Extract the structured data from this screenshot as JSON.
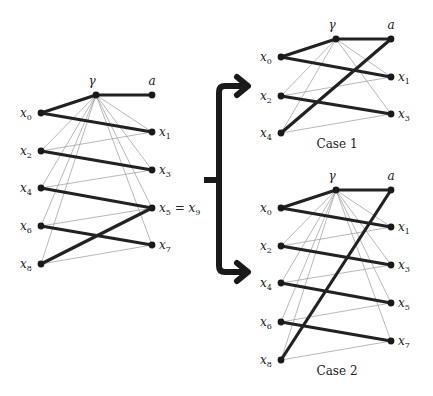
{
  "colors": {
    "ink": "#222222",
    "thin_edge": "#9a9a9a",
    "background": "#ffffff"
  },
  "graphs": [
    {
      "id": "original",
      "nodes": [
        {
          "id": "gamma",
          "label": "γ",
          "sub": "",
          "x": 96,
          "y": 95,
          "lx": 92,
          "ly": 85,
          "anchor": "middle"
        },
        {
          "id": "a",
          "label": "a",
          "sub": "",
          "x": 152,
          "y": 95,
          "lx": 152,
          "ly": 85,
          "anchor": "middle"
        },
        {
          "id": "x0",
          "label": "x",
          "sub": "0",
          "x": 41,
          "y": 113,
          "lx": 20,
          "ly": 117,
          "anchor": "start"
        },
        {
          "id": "x1",
          "label": "x",
          "sub": "1",
          "x": 152,
          "y": 132,
          "lx": 159,
          "ly": 136,
          "anchor": "start"
        },
        {
          "id": "x2",
          "label": "x",
          "sub": "2",
          "x": 41,
          "y": 151,
          "lx": 20,
          "ly": 155,
          "anchor": "start"
        },
        {
          "id": "x3",
          "label": "x",
          "sub": "3",
          "x": 152,
          "y": 170,
          "lx": 159,
          "ly": 174,
          "anchor": "start"
        },
        {
          "id": "x4",
          "label": "x",
          "sub": "4",
          "x": 41,
          "y": 188,
          "lx": 20,
          "ly": 192,
          "anchor": "start"
        },
        {
          "id": "x5",
          "label": "x",
          "sub": "5",
          "x": 152,
          "y": 208,
          "lx": 159,
          "ly": 212,
          "anchor": "start",
          "suffix": " = x",
          "suffix_sub": "9"
        },
        {
          "id": "x6",
          "label": "x",
          "sub": "6",
          "x": 41,
          "y": 226,
          "lx": 20,
          "ly": 230,
          "anchor": "start"
        },
        {
          "id": "x7",
          "label": "x",
          "sub": "7",
          "x": 152,
          "y": 245,
          "lx": 159,
          "ly": 249,
          "anchor": "start"
        },
        {
          "id": "x8",
          "label": "x",
          "sub": "8",
          "x": 41,
          "y": 264,
          "lx": 20,
          "ly": 268,
          "anchor": "start"
        }
      ],
      "thick_edges": [
        [
          "gamma",
          "a"
        ],
        [
          "gamma",
          "x0"
        ],
        [
          "x0",
          "x1"
        ],
        [
          "x2",
          "x3"
        ],
        [
          "x4",
          "x5"
        ],
        [
          "x6",
          "x7"
        ],
        [
          "x8",
          "x5"
        ]
      ],
      "thin_edges": [
        [
          "gamma",
          "x1"
        ],
        [
          "gamma",
          "x2"
        ],
        [
          "gamma",
          "x3"
        ],
        [
          "gamma",
          "x4"
        ],
        [
          "gamma",
          "x5"
        ],
        [
          "gamma",
          "x6"
        ],
        [
          "gamma",
          "x7"
        ],
        [
          "gamma",
          "x8"
        ],
        [
          "x1",
          "x2"
        ],
        [
          "x3",
          "x4"
        ],
        [
          "x5",
          "x6"
        ],
        [
          "x7",
          "x8"
        ]
      ],
      "caption": ""
    },
    {
      "id": "case1",
      "nodes": [
        {
          "id": "gamma",
          "label": "γ",
          "sub": "",
          "x": 336,
          "y": 39,
          "lx": 332,
          "ly": 29,
          "anchor": "middle"
        },
        {
          "id": "a",
          "label": "a",
          "sub": "",
          "x": 391,
          "y": 39,
          "lx": 391,
          "ly": 29,
          "anchor": "middle"
        },
        {
          "id": "x0",
          "label": "x",
          "sub": "0",
          "x": 281,
          "y": 57,
          "lx": 260,
          "ly": 61,
          "anchor": "start"
        },
        {
          "id": "x1",
          "label": "x",
          "sub": "1",
          "x": 391,
          "y": 77,
          "lx": 398,
          "ly": 81,
          "anchor": "start"
        },
        {
          "id": "x2",
          "label": "x",
          "sub": "2",
          "x": 281,
          "y": 96,
          "lx": 260,
          "ly": 100,
          "anchor": "start"
        },
        {
          "id": "x3",
          "label": "x",
          "sub": "3",
          "x": 391,
          "y": 114,
          "lx": 398,
          "ly": 118,
          "anchor": "start"
        },
        {
          "id": "x4",
          "label": "x",
          "sub": "4",
          "x": 281,
          "y": 133,
          "lx": 260,
          "ly": 137,
          "anchor": "start"
        }
      ],
      "thick_edges": [
        [
          "gamma",
          "a"
        ],
        [
          "gamma",
          "x0"
        ],
        [
          "x0",
          "x1"
        ],
        [
          "x2",
          "x3"
        ],
        [
          "x4",
          "a"
        ]
      ],
      "thin_edges": [
        [
          "gamma",
          "x1"
        ],
        [
          "gamma",
          "x2"
        ],
        [
          "gamma",
          "x3"
        ],
        [
          "gamma",
          "x4"
        ],
        [
          "x1",
          "x2"
        ],
        [
          "x3",
          "x4"
        ]
      ],
      "caption": "Case 1",
      "caption_pos": {
        "x": 337,
        "y": 148
      }
    },
    {
      "id": "case2",
      "nodes": [
        {
          "id": "gamma",
          "label": "γ",
          "sub": "",
          "x": 336,
          "y": 190,
          "lx": 332,
          "ly": 180,
          "anchor": "middle"
        },
        {
          "id": "a",
          "label": "a",
          "sub": "",
          "x": 391,
          "y": 190,
          "lx": 391,
          "ly": 180,
          "anchor": "middle"
        },
        {
          "id": "x0",
          "label": "x",
          "sub": "0",
          "x": 281,
          "y": 208,
          "lx": 260,
          "ly": 212,
          "anchor": "start"
        },
        {
          "id": "x1",
          "label": "x",
          "sub": "1",
          "x": 391,
          "y": 227,
          "lx": 398,
          "ly": 231,
          "anchor": "start"
        },
        {
          "id": "x2",
          "label": "x",
          "sub": "2",
          "x": 281,
          "y": 246,
          "lx": 260,
          "ly": 250,
          "anchor": "start"
        },
        {
          "id": "x3",
          "label": "x",
          "sub": "3",
          "x": 391,
          "y": 265,
          "lx": 398,
          "ly": 269,
          "anchor": "start"
        },
        {
          "id": "x4",
          "label": "x",
          "sub": "4",
          "x": 281,
          "y": 283,
          "lx": 260,
          "ly": 287,
          "anchor": "start"
        },
        {
          "id": "x5",
          "label": "x",
          "sub": "5",
          "x": 391,
          "y": 303,
          "lx": 398,
          "ly": 307,
          "anchor": "start"
        },
        {
          "id": "x6",
          "label": "x",
          "sub": "6",
          "x": 281,
          "y": 322,
          "lx": 260,
          "ly": 326,
          "anchor": "start"
        },
        {
          "id": "x7",
          "label": "x",
          "sub": "7",
          "x": 391,
          "y": 341,
          "lx": 398,
          "ly": 345,
          "anchor": "start"
        },
        {
          "id": "x8",
          "label": "x",
          "sub": "8",
          "x": 281,
          "y": 360,
          "lx": 260,
          "ly": 364,
          "anchor": "start"
        }
      ],
      "thick_edges": [
        [
          "gamma",
          "a"
        ],
        [
          "gamma",
          "x0"
        ],
        [
          "x0",
          "x1"
        ],
        [
          "x2",
          "x3"
        ],
        [
          "x4",
          "x5"
        ],
        [
          "x6",
          "x7"
        ],
        [
          "x8",
          "a"
        ]
      ],
      "thin_edges": [
        [
          "gamma",
          "x1"
        ],
        [
          "gamma",
          "x2"
        ],
        [
          "gamma",
          "x3"
        ],
        [
          "gamma",
          "x4"
        ],
        [
          "gamma",
          "x5"
        ],
        [
          "gamma",
          "x6"
        ],
        [
          "gamma",
          "x7"
        ],
        [
          "gamma",
          "x8"
        ],
        [
          "x1",
          "x2"
        ],
        [
          "x3",
          "x4"
        ],
        [
          "x5",
          "x6"
        ],
        [
          "x7",
          "x8"
        ]
      ],
      "caption": "Case 2",
      "caption_pos": {
        "x": 337,
        "y": 375
      }
    }
  ],
  "brace": {
    "spine_x": 219,
    "top_y": 86,
    "bottom_y": 272,
    "mid_y": 180,
    "tick_x": 204,
    "arrow_tip_x": 248,
    "targets": [
      "Case 1",
      "Case 2"
    ]
  }
}
